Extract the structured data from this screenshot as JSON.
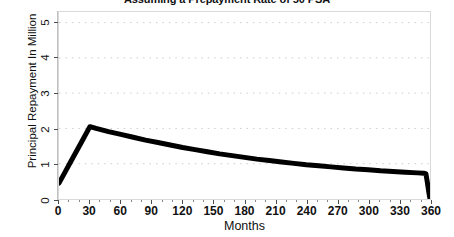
{
  "chart_data": {
    "type": "line",
    "title": "Assuming a Prepayment Rate of 50 PSA",
    "xlabel": "Months",
    "ylabel": "Principal Repayment In Million",
    "xlim": [
      0,
      360
    ],
    "ylim": [
      0,
      5.3
    ],
    "xticks": [
      0,
      30,
      60,
      90,
      120,
      150,
      180,
      210,
      240,
      270,
      300,
      330,
      360
    ],
    "yticks": [
      0,
      1,
      2,
      3,
      4,
      5
    ],
    "xtick_labels": [
      "0",
      "30",
      "60",
      "90",
      "120",
      "150",
      "180",
      "210",
      "240",
      "270",
      "300",
      "330",
      "360"
    ],
    "ytick_labels": [
      "0",
      "1",
      "2",
      "3",
      "4",
      "5"
    ],
    "grid": "dotted-horizontal",
    "grid_color": "#cccccc",
    "legend": "none",
    "line_color": "#000000",
    "line_width": 5,
    "series": [
      {
        "name": "Principal Repayment",
        "x": [
          0,
          6,
          12,
          18,
          24,
          30,
          36,
          48,
          60,
          72,
          84,
          96,
          108,
          120,
          132,
          144,
          156,
          168,
          180,
          192,
          204,
          216,
          228,
          240,
          252,
          264,
          276,
          288,
          300,
          312,
          324,
          336,
          348,
          354,
          356,
          357,
          358,
          359,
          360
        ],
        "values": [
          0.45,
          0.77,
          1.09,
          1.41,
          1.73,
          2.05,
          2.0,
          1.91,
          1.83,
          1.75,
          1.67,
          1.6,
          1.53,
          1.46,
          1.4,
          1.34,
          1.28,
          1.23,
          1.18,
          1.13,
          1.09,
          1.05,
          1.01,
          0.97,
          0.94,
          0.91,
          0.88,
          0.85,
          0.83,
          0.8,
          0.78,
          0.76,
          0.74,
          0.73,
          0.72,
          0.55,
          0.36,
          0.17,
          0.0
        ]
      }
    ],
    "annotations": {
      "peak_month": 30,
      "peak_value": 2.05,
      "start_value": 0.45,
      "end_value": 0.0
    }
  },
  "chart": {
    "title": "Assuming a Prepayment Rate of 50 PSA",
    "x_axis_title": "Months",
    "y_axis_title": "Principal Repayment In Million"
  }
}
